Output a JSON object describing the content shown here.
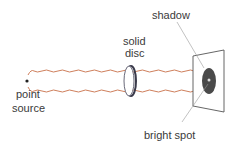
{
  "diagram": {
    "type": "physics-optics",
    "labels": {
      "shadow": "shadow",
      "disc_line1": "solid",
      "disc_line2": "disc",
      "source_line1": "point",
      "source_line2": "source",
      "bright_spot": "bright spot"
    },
    "colors": {
      "wave": "#c8714a",
      "text": "#3a3a3a",
      "shadow": "#4a4a4a",
      "screen": "#555555",
      "disc": "#5a5a6a"
    }
  }
}
